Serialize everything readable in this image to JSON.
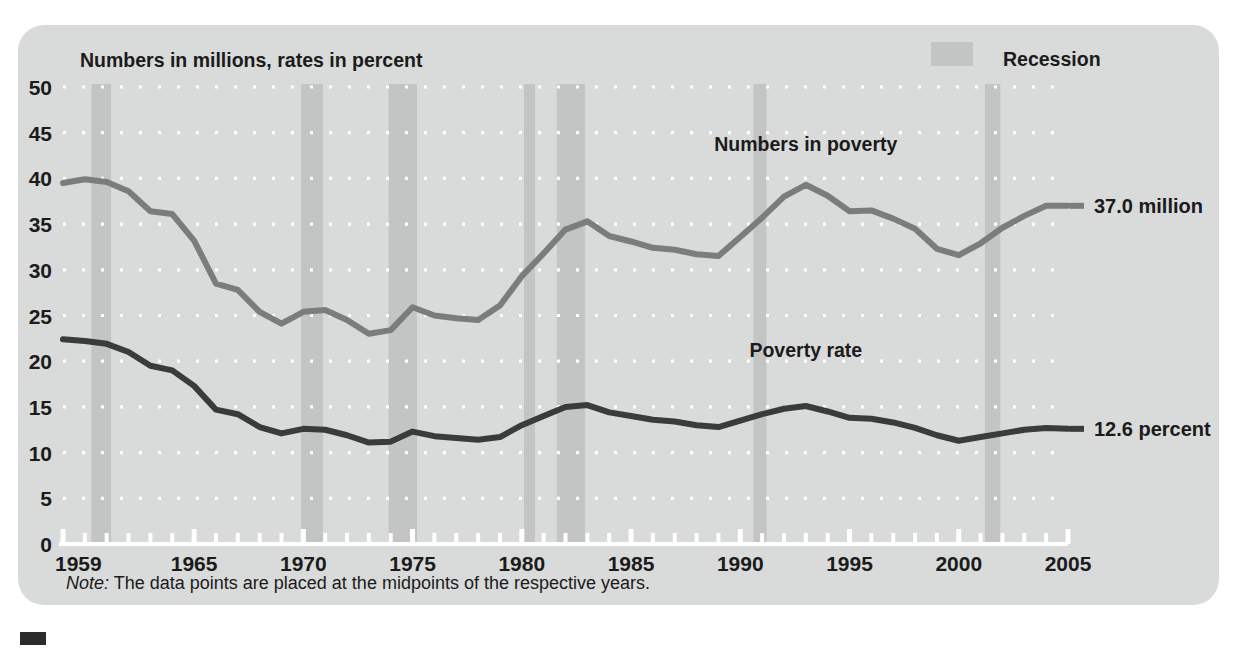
{
  "figure": {
    "header_note": "Numbers in millions, rates in percent",
    "legend": {
      "recession_label": "Recession",
      "recession_color": "#c3c4c4"
    },
    "footnote_prefix": "Note:",
    "footnote_text": " The data points are placed at the midpoints of the respective years.",
    "card_color": "#d9dada",
    "gridline_color": "#ffffff"
  },
  "chart_data": {
    "type": "line",
    "title": "Numbers in millions, rates in percent",
    "xlabel": "",
    "ylabel": "",
    "xlim": [
      1959,
      2005
    ],
    "ylim": [
      0,
      50
    ],
    "ytick_step": 5,
    "grid": "horizontal dotted white",
    "legend_position": "top-right",
    "yticks": [
      "50",
      "45",
      "40",
      "35",
      "30",
      "25",
      "20",
      "15",
      "10",
      "5",
      "0"
    ],
    "xticks": [
      "1959",
      "1965",
      "1970",
      "1975",
      "1980",
      "1985",
      "1990",
      "1995",
      "2000",
      "2005"
    ],
    "xtick_years": [
      1959,
      1965,
      1970,
      1975,
      1980,
      1985,
      1990,
      1995,
      2000,
      2005
    ],
    "x": [
      1959,
      1960,
      1961,
      1962,
      1963,
      1964,
      1965,
      1966,
      1967,
      1968,
      1969,
      1970,
      1971,
      1972,
      1973,
      1974,
      1975,
      1976,
      1977,
      1978,
      1979,
      1980,
      1981,
      1982,
      1983,
      1984,
      1985,
      1986,
      1987,
      1988,
      1989,
      1990,
      1991,
      1992,
      1993,
      1994,
      1995,
      1996,
      1997,
      1998,
      1999,
      2000,
      2001,
      2002,
      2003,
      2004,
      2005
    ],
    "series": [
      {
        "name": "Numbers in poverty",
        "color": "#7b7d7d",
        "unit": "million",
        "end_label": "37.0 million",
        "end_value": 37.0,
        "values": [
          39.5,
          39.9,
          39.6,
          38.6,
          36.4,
          36.1,
          33.2,
          28.5,
          27.8,
          25.4,
          24.1,
          25.4,
          25.6,
          24.5,
          23.0,
          23.4,
          25.9,
          25.0,
          24.7,
          24.5,
          26.1,
          29.3,
          31.8,
          34.4,
          35.3,
          33.7,
          33.1,
          32.4,
          32.2,
          31.7,
          31.5,
          33.6,
          35.7,
          38.0,
          39.3,
          38.1,
          36.4,
          36.5,
          35.6,
          34.5,
          32.3,
          31.6,
          32.9,
          34.6,
          35.9,
          37.0,
          37.0
        ]
      },
      {
        "name": "Poverty rate",
        "color": "#3a3b3b",
        "unit": "percent",
        "end_label": "12.6 percent",
        "end_value": 12.6,
        "values": [
          22.4,
          22.2,
          21.9,
          21.0,
          19.5,
          19.0,
          17.3,
          14.7,
          14.2,
          12.8,
          12.1,
          12.6,
          12.5,
          11.9,
          11.1,
          11.2,
          12.3,
          11.8,
          11.6,
          11.4,
          11.7,
          13.0,
          14.0,
          15.0,
          15.2,
          14.4,
          14.0,
          13.6,
          13.4,
          13.0,
          12.8,
          13.5,
          14.2,
          14.8,
          15.1,
          14.5,
          13.8,
          13.7,
          13.3,
          12.7,
          11.9,
          11.3,
          11.7,
          12.1,
          12.5,
          12.7,
          12.6
        ]
      }
    ],
    "recessions": [
      {
        "start": 1960.3,
        "end": 1961.2
      },
      {
        "start": 1969.9,
        "end": 1970.9
      },
      {
        "start": 1973.9,
        "end": 1975.2
      },
      {
        "start": 1980.1,
        "end": 1980.6
      },
      {
        "start": 1981.6,
        "end": 1982.9
      },
      {
        "start": 1990.6,
        "end": 1991.2
      },
      {
        "start": 2001.2,
        "end": 2001.9
      }
    ],
    "annotations": [
      {
        "name": "numbers-in-poverty-label",
        "text": "Numbers in poverty",
        "x": 1993.0,
        "y": 43.0
      },
      {
        "name": "poverty-rate-label",
        "text": "Poverty rate",
        "x": 1993.0,
        "y": 20.5
      }
    ]
  }
}
